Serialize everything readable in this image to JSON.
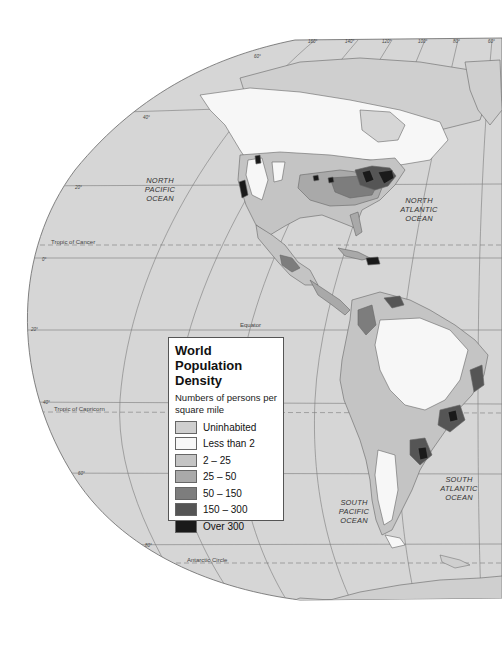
{
  "map": {
    "title": "World Population Density",
    "subtitle": "Numbers of persons per square mile",
    "ocean_labels": [
      {
        "id": "north-pacific",
        "text": "NORTH\nPACIFIC\nOCEAN"
      },
      {
        "id": "north-atlantic",
        "text": "NORTH\nATLANTIC\nOCEAN"
      },
      {
        "id": "south-pacific",
        "text": "SOUTH\nPACIFIC\nOCEAN"
      },
      {
        "id": "south-atlantic",
        "text": "SOUTH\nATLANTIC\nOCEAN"
      }
    ],
    "reference_lines": {
      "tropic_of_cancer": "Tropic of Cancer",
      "equator": "Equator",
      "tropic_of_capricorn": "Tropic of Capricorn",
      "antarctic_circle": "Antarctic Circle"
    },
    "longitude_labels": [
      "160°",
      "140°",
      "120°",
      "100°",
      "80°",
      "60°"
    ],
    "latitude_labels": {
      "n60": "60°",
      "n40": "40°",
      "n20": "20°",
      "eq": "0°",
      "s20": "20°",
      "s40": "40°",
      "s60": "60°",
      "s80": "80°"
    },
    "colors": {
      "background": "#ffffff",
      "ocean": "#d6d6d6",
      "uninhabited": "#cfcfcf",
      "less_than_2": "#f7f7f7",
      "d2_25": "#c4c4c4",
      "d25_50": "#a9a9a9",
      "d50_150": "#7d7d7d",
      "d150_300": "#555555",
      "over_300": "#1a1a1a",
      "grid": "#777777",
      "coast": "#666666"
    }
  },
  "legend": {
    "title": "World Population Density",
    "subtitle": "Numbers of persons per square mile",
    "items": [
      {
        "label": "Uninhabited",
        "color": "#cfcfcf"
      },
      {
        "label": "Less than 2",
        "color": "#f7f7f7"
      },
      {
        "label": "2 – 25",
        "color": "#c4c4c4"
      },
      {
        "label": "25 – 50",
        "color": "#a9a9a9"
      },
      {
        "label": "50 – 150",
        "color": "#7d7d7d"
      },
      {
        "label": "150 – 300",
        "color": "#555555"
      },
      {
        "label": "Over 300",
        "color": "#1a1a1a"
      }
    ]
  }
}
